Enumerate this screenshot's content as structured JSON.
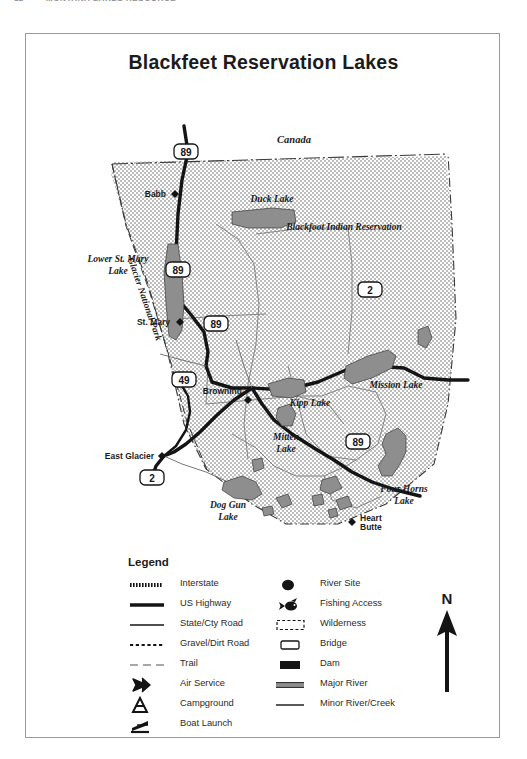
{
  "page_header": {
    "page_number": "12",
    "running_title": "MONTANA LAKES RESOURCE"
  },
  "map": {
    "title": "Blackfeet Reservation Lakes",
    "area_labels": [
      {
        "name": "Canada",
        "text": "Canada"
      },
      {
        "name": "Blackfoot Indian Reservation",
        "text": "Blackfoot Indian Reservation"
      },
      {
        "name": "Glacier National Park",
        "text": "Glacier National Park"
      }
    ],
    "lake_labels": [
      {
        "text": "Duck Lake"
      },
      {
        "text": "Lower St. Mary"
      },
      {
        "text": "Lake"
      },
      {
        "text": "Kipp Lake"
      },
      {
        "text": "Mission Lake"
      },
      {
        "text": "Mitten"
      },
      {
        "text": "Lake"
      },
      {
        "text": "Dog Gun"
      },
      {
        "text": "Lake"
      },
      {
        "text": "Four Horns"
      },
      {
        "text": "Lake"
      }
    ],
    "towns": [
      {
        "text": "Babb"
      },
      {
        "text": "St. Mary"
      },
      {
        "text": "Browning"
      },
      {
        "text": "East Glacier"
      },
      {
        "text": "Heart"
      },
      {
        "text": "Butte"
      }
    ],
    "highway_shields": [
      {
        "number": "89",
        "type": "us"
      },
      {
        "number": "89",
        "type": "us"
      },
      {
        "number": "89",
        "type": "us"
      },
      {
        "number": "89",
        "type": "us"
      },
      {
        "number": "2",
        "type": "us"
      },
      {
        "number": "2",
        "type": "us"
      },
      {
        "number": "49",
        "type": "state"
      }
    ]
  },
  "legend": {
    "title": "Legend",
    "left_items": [
      {
        "icon": "interstate-symbol",
        "label": "Interstate"
      },
      {
        "icon": "us-highway-symbol",
        "label": "US Highway"
      },
      {
        "icon": "state-road-symbol",
        "label": "State/Cty Road"
      },
      {
        "icon": "gravel-road-symbol",
        "label": "Gravel/Dirt Road"
      },
      {
        "icon": "trail-symbol",
        "label": "Trail"
      },
      {
        "icon": "airplane-icon",
        "label": "Air Service"
      },
      {
        "icon": "tent-icon",
        "label": "Campground"
      },
      {
        "icon": "boat-launch-icon",
        "label": "Boat Launch"
      }
    ],
    "right_items": [
      {
        "icon": "river-site-dot-icon",
        "label": "River Site"
      },
      {
        "icon": "fish-icon",
        "label": "Fishing Access"
      },
      {
        "icon": "wilderness-box-icon",
        "label": "Wilderness"
      },
      {
        "icon": "bridge-box-icon",
        "label": "Bridge"
      },
      {
        "icon": "dam-bar-icon",
        "label": "Dam"
      },
      {
        "icon": "major-river-symbol",
        "label": "Major River"
      },
      {
        "icon": "minor-river-symbol",
        "label": "Minor River/Creek"
      }
    ]
  },
  "north_arrow": {
    "label": "N"
  },
  "colors": {
    "lake_fill": "#8e8e8e",
    "reservation_stipple": "#5a5a5a",
    "road_dark": "#141414",
    "frame": "#9a9a9a",
    "text": "#1b1b1b"
  }
}
